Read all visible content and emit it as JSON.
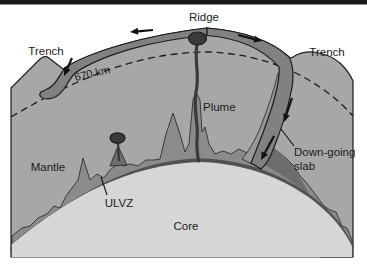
{
  "figure": {
    "labels": {
      "ridge": "Ridge",
      "trench_left": "Trench",
      "trench_right": "Trench",
      "depth_marker": "670 km",
      "plume": "Plume",
      "mantle": "Mantle",
      "ulvz": "ULVZ",
      "core": "Core",
      "downgoing_line1": "Down-going",
      "downgoing_line2": "slab"
    },
    "colors": {
      "background": "#ffffff",
      "top_bar": "#1b1b1b",
      "mantle": "#a7a7a7",
      "core": "#d6d6d6",
      "lithosphere_slab": "#818181",
      "slab_sheath": "#989898",
      "boundary_layer": "#8b8b8b",
      "slab_pool": "#6d6d6d",
      "corner_blob": "#606060",
      "cmb_band": "#515151",
      "plume": "#3a3a3a",
      "label_text": "#1b1b1b"
    }
  }
}
